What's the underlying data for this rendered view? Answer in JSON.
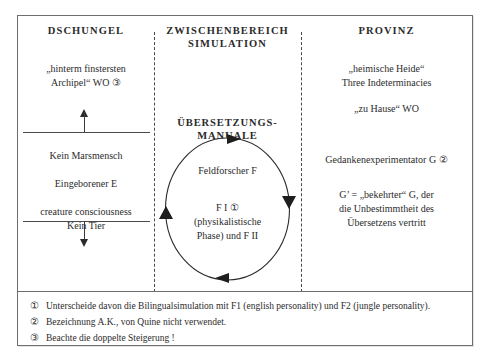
{
  "top_sliver": "",
  "columns": {
    "left": {
      "title": "DSCHUNGEL",
      "quote_line1": "„hinterm finstersten",
      "quote_line2": "Archipel“ WO ③",
      "line1": "Kein Marsmensch",
      "line2": "Eingeborener E",
      "line3a": "creature consciousness",
      "line3b": "Kein Tier"
    },
    "middle": {
      "title_line1": "ZWISCHENBEREICH",
      "title_line2": "SIMULATION",
      "manual_line1": "ÜBERSETZUNGS-",
      "manual_line2": "MANUALE",
      "circle_line1": "Feldforscher F",
      "circle_line2": "F I ①",
      "circle_line3": "(physikalistische",
      "circle_line4": "Phase) und F II"
    },
    "right": {
      "title": "PROVINZ",
      "quote_line1": "„heimische Heide“",
      "quote_line2": "Three Indeterminacies",
      "quote_line3": "„zu Hause“ WO",
      "g_line": "Gedankenexperimentator G ②",
      "gprime_line1": "G’ = „bekehrter“ G, der",
      "gprime_line2": "die Unbestimmtheit des",
      "gprime_line3": "Übersetzens vertritt"
    }
  },
  "footnotes": [
    {
      "marker": "①",
      "text": "Unterscheide davon die Bilingualsimulation mit F1 (english personality) und F2 (jungle personality)."
    },
    {
      "marker": "②",
      "text": "Bezeichnung A.K., von Quine nicht verwendet."
    },
    {
      "marker": "③",
      "text": "Beachte die doppelte Steigerung !"
    }
  ],
  "colors": {
    "ink": "#2b2b2b",
    "rule": "#6e6e6e",
    "dashed_divider": "#4a4a4a"
  }
}
